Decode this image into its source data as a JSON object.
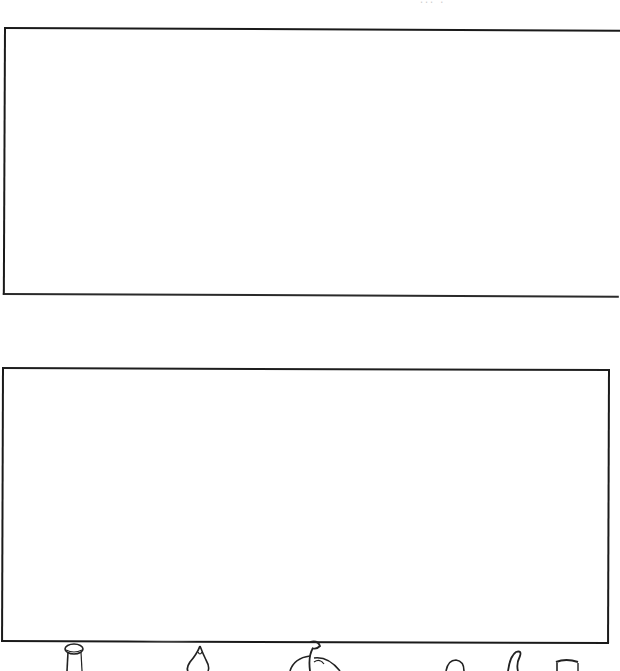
{
  "page": {
    "header_fragment": "∙∙∙ ∙",
    "background_color": "#ffffff",
    "line_color": "#1a1a1a"
  },
  "boxes": [
    {
      "id": "top",
      "label": "",
      "content": ""
    },
    {
      "id": "bottom",
      "label": "",
      "content": ""
    }
  ],
  "footer_doodles": [
    {
      "name": "jar-doodle"
    },
    {
      "name": "drop-doodle"
    },
    {
      "name": "apple-doodle"
    },
    {
      "name": "round-doodle"
    },
    {
      "name": "leaf-doodle"
    },
    {
      "name": "cup-doodle"
    }
  ]
}
